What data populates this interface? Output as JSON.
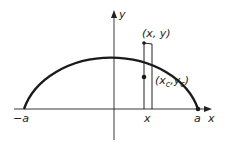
{
  "diagram": {
    "type": "semi-ellipse area element",
    "colors": {
      "ink": "#222222",
      "background": "#ffffff"
    },
    "axes": {
      "x_label": "x",
      "y_label": "y"
    },
    "labels": {
      "left_end": "−a",
      "right_end": "a",
      "strip_x": "x",
      "point_on_curve": "(x, y)",
      "centroid_open": "(x",
      "centroid_sub_c1": "c",
      "centroid_mid": ",y",
      "centroid_sub_c2": "c",
      "centroid_close": ")"
    },
    "elements": [
      "semi-ellipse curve from -a to a",
      "vertical strip at x with width dx",
      "centroid dot of strip (x_c, y_c)",
      "dot at x = a"
    ]
  }
}
